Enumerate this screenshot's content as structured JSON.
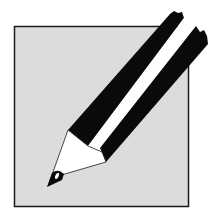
{
  "icon": {
    "name": "pencil-edit-icon",
    "colors": {
      "background": "#ffffff",
      "square_fill": "#dcdcdc",
      "square_border": "#1a1a1a",
      "pencil_black": "#0a0a0a",
      "pencil_white": "#ffffff"
    }
  }
}
